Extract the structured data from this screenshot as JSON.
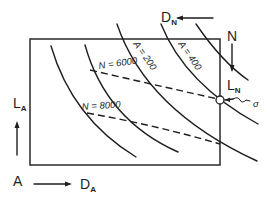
{
  "diagram": {
    "type": "operating-map",
    "colors": {
      "ink": "#1e1e1e",
      "background": "#ffffff"
    },
    "axis_labels": {
      "lift_axis": {
        "main": "L",
        "sub": "A"
      },
      "drag_axis": {
        "main": "D",
        "sub": "A"
      },
      "origin_label": "A",
      "drag_n": {
        "main": "D",
        "sub": "N"
      },
      "lift_n": {
        "main": "L",
        "sub": "N"
      },
      "n_label": "N"
    },
    "curve_labels": {
      "a200": "A = 200",
      "a400": "A = 400"
    },
    "dashed_labels": {
      "n6000": "N = 6000",
      "n8000": "N = 8000"
    },
    "operating_point": {
      "label": "σ"
    }
  }
}
